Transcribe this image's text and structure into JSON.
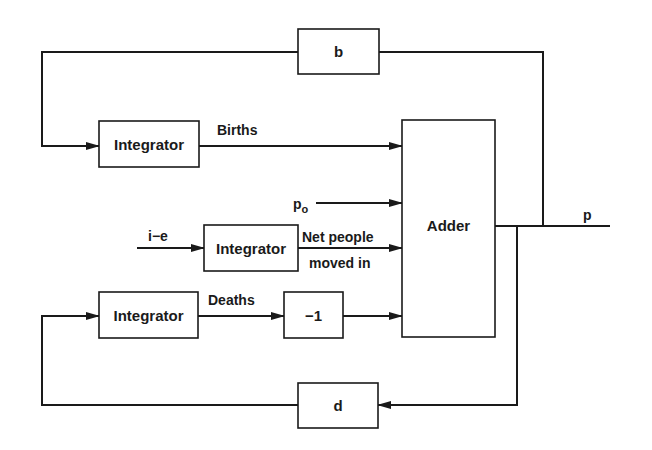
{
  "diagram": {
    "type": "block-diagram",
    "blocks": {
      "b": "b",
      "integrator_births": "Integrator",
      "integrator_net": "Integrator",
      "integrator_deaths": "Integrator",
      "negate": "−1",
      "adder": "Adder",
      "d": "d"
    },
    "signals": {
      "births": "Births",
      "p0_main": "p",
      "p0_sub": "o",
      "ie": "i−e",
      "net_line1": "Net people",
      "net_line2": "moved in",
      "deaths": "Deaths",
      "output": "p"
    },
    "colors": {
      "line": "#1a1a1a",
      "background": "#ffffff"
    }
  }
}
